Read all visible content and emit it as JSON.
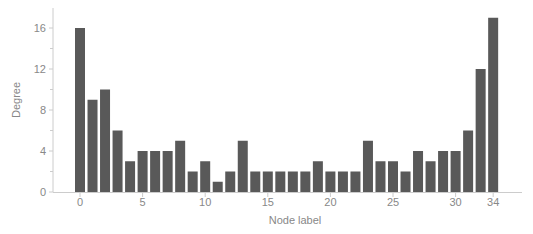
{
  "chart_data": {
    "type": "bar",
    "title": "",
    "xlabel": "Node label",
    "ylabel": "Degree",
    "categories": [
      0,
      1,
      2,
      3,
      4,
      5,
      6,
      7,
      8,
      9,
      10,
      11,
      12,
      13,
      14,
      15,
      16,
      17,
      18,
      19,
      20,
      21,
      22,
      23,
      24,
      25,
      26,
      27,
      28,
      29,
      30,
      31,
      32,
      33
    ],
    "values": [
      16,
      9,
      10,
      6,
      3,
      4,
      4,
      4,
      5,
      2,
      3,
      1,
      2,
      5,
      2,
      2,
      2,
      2,
      2,
      3,
      2,
      2,
      2,
      5,
      3,
      3,
      2,
      4,
      3,
      4,
      4,
      6,
      12,
      17
    ],
    "x_tick_labels": [
      {
        "index": 0,
        "label": "0"
      },
      {
        "index": 5,
        "label": "5"
      },
      {
        "index": 10,
        "label": "10"
      },
      {
        "index": 15,
        "label": "15"
      },
      {
        "index": 20,
        "label": "20"
      },
      {
        "index": 25,
        "label": "25"
      },
      {
        "index": 30,
        "label": "30"
      },
      {
        "index": 33,
        "label": "34"
      }
    ],
    "y_ticks": [
      0,
      4,
      8,
      12,
      16
    ],
    "y_minor_ticks": [
      2,
      6,
      10,
      14
    ],
    "ylim": [
      0,
      18
    ],
    "grid": false,
    "legend": null,
    "colors": {
      "bar": "#595959",
      "axis": "#cccccc",
      "text": "#888888"
    }
  }
}
